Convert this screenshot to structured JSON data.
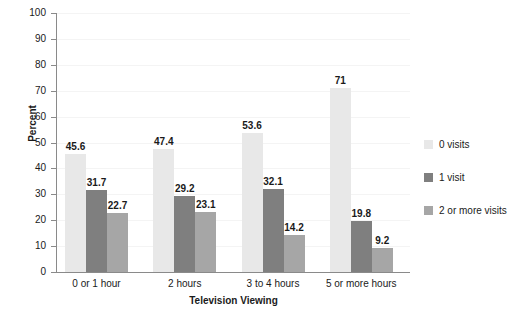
{
  "chart_data": {
    "type": "bar",
    "title": "",
    "xlabel": "Television Viewing",
    "ylabel": "Percent",
    "ylim": [
      0,
      100
    ],
    "ytick_step": 10,
    "yticks": [
      100,
      90,
      80,
      70,
      60,
      50,
      40,
      30,
      20,
      10,
      0
    ],
    "grid": true,
    "legend_position": "right",
    "categories": [
      "0 or 1 hour",
      "2 hours",
      "3 to 4 hours",
      "5 or more hours"
    ],
    "series": [
      {
        "name": "0 visits",
        "color": "#e8e8e8",
        "values": [
          45.6,
          47.4,
          53.6,
          71
        ],
        "labels": [
          "45.6",
          "47.4",
          "53.6",
          "71"
        ]
      },
      {
        "name": "1 visit",
        "color": "#7f7f7f",
        "values": [
          31.7,
          29.2,
          32.1,
          19.8
        ],
        "labels": [
          "31.7",
          "29.2",
          "32.1",
          "19.8"
        ]
      },
      {
        "name": "2 or more visits",
        "color": "#a6a6a6",
        "values": [
          22.7,
          23.1,
          14.2,
          9.2
        ],
        "labels": [
          "22.7",
          "23.1",
          "14.2",
          "9.2"
        ]
      }
    ]
  }
}
